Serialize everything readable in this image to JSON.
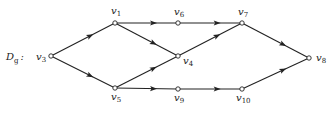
{
  "graph": {
    "name": "D",
    "name_sub": "g",
    "name_suffix": ":",
    "nodes": [
      {
        "id": "v1",
        "base": "v",
        "sub": "1",
        "x": 115,
        "y": 23,
        "lx": 111,
        "ly": 14
      },
      {
        "id": "v3",
        "base": "v",
        "sub": "3",
        "x": 51,
        "y": 56,
        "lx": 36,
        "ly": 60
      },
      {
        "id": "v4",
        "base": "v",
        "sub": "4",
        "x": 178,
        "y": 56,
        "lx": 183,
        "ly": 64
      },
      {
        "id": "v5",
        "base": "v",
        "sub": "5",
        "x": 115,
        "y": 88,
        "lx": 111,
        "ly": 100
      },
      {
        "id": "v6",
        "base": "v",
        "sub": "6",
        "x": 178,
        "y": 23,
        "lx": 174,
        "ly": 15
      },
      {
        "id": "v7",
        "base": "v",
        "sub": "7",
        "x": 242,
        "y": 23,
        "lx": 238,
        "ly": 15
      },
      {
        "id": "v8",
        "base": "v",
        "sub": "8",
        "x": 309,
        "y": 58,
        "lx": 316,
        "ly": 61
      },
      {
        "id": "v9",
        "base": "v",
        "sub": "9",
        "x": 178,
        "y": 89,
        "lx": 174,
        "ly": 101
      },
      {
        "id": "v10",
        "base": "v",
        "sub": "10",
        "x": 242,
        "y": 89,
        "lx": 236,
        "ly": 101
      }
    ],
    "edges": [
      {
        "from": "v3",
        "to": "v1"
      },
      {
        "from": "v3",
        "to": "v5"
      },
      {
        "from": "v1",
        "to": "v6"
      },
      {
        "from": "v1",
        "to": "v4"
      },
      {
        "from": "v5",
        "to": "v4"
      },
      {
        "from": "v5",
        "to": "v9"
      },
      {
        "from": "v6",
        "to": "v7"
      },
      {
        "from": "v4",
        "to": "v7"
      },
      {
        "from": "v9",
        "to": "v10"
      },
      {
        "from": "v7",
        "to": "v8"
      },
      {
        "from": "v10",
        "to": "v8"
      }
    ]
  }
}
